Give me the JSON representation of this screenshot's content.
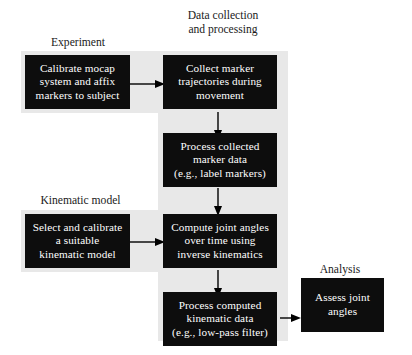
{
  "diagram": {
    "background_color": "#ffffff",
    "box_fill_color": "#0d0d0d",
    "box_text_color": "#ffffff",
    "shade_color": "#e8e8e8",
    "arrow_color": "#000000"
  },
  "headings": [
    {
      "id": "experiment",
      "text": "Experiment"
    },
    {
      "id": "data-collection",
      "line1": "Data collection",
      "line2": "and processing"
    },
    {
      "id": "kinematic-model",
      "text": "Kinematic model"
    },
    {
      "id": "analysis",
      "text": "Analysis"
    }
  ],
  "nodes": [
    {
      "id": "calibrate-mocap",
      "lines": [
        "Calibrate mocap",
        "system and affix",
        "markers to subject"
      ]
    },
    {
      "id": "collect-marker-trajectories",
      "lines": [
        "Collect marker",
        "trajectories during",
        "movement"
      ]
    },
    {
      "id": "process-collected-marker-data",
      "lines": [
        "Process collected",
        "marker data",
        "(e.g., label markers)"
      ]
    },
    {
      "id": "select-kinematic-model",
      "lines": [
        "Select and calibrate",
        "a suitable",
        "kinematic model"
      ]
    },
    {
      "id": "compute-joint-angles",
      "lines": [
        "Compute joint angles",
        "over time using",
        "inverse kinematics"
      ]
    },
    {
      "id": "process-computed-kinematic-data",
      "lines": [
        "Process computed",
        "kinematic data",
        "(e.g., low-pass filter)"
      ]
    },
    {
      "id": "assess-joint-angles",
      "lines": [
        "Assess joint",
        "angles"
      ]
    }
  ],
  "edges": [
    {
      "id": "calibrate-to-collect",
      "from": "calibrate-mocap",
      "to": "collect-marker-trajectories",
      "direction": "right"
    },
    {
      "id": "collect-to-process-marker",
      "from": "collect-marker-trajectories",
      "to": "process-collected-marker-data",
      "direction": "down"
    },
    {
      "id": "process-marker-to-compute",
      "from": "process-collected-marker-data",
      "to": "compute-joint-angles",
      "direction": "down"
    },
    {
      "id": "select-model-to-compute",
      "from": "select-kinematic-model",
      "to": "compute-joint-angles",
      "direction": "right"
    },
    {
      "id": "compute-to-process-kinematic",
      "from": "compute-joint-angles",
      "to": "process-computed-kinematic-data",
      "direction": "down"
    },
    {
      "id": "process-kinematic-to-assess",
      "from": "process-computed-kinematic-data",
      "to": "assess-joint-angles",
      "direction": "right"
    }
  ]
}
